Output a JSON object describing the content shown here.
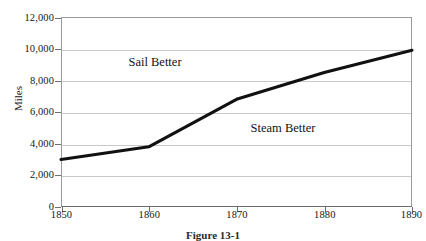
{
  "chart_data": {
    "type": "line",
    "title": "",
    "xlabel": "",
    "ylabel": "Miles",
    "x": [
      1850,
      1860,
      1870,
      1880,
      1890
    ],
    "values": [
      3000,
      3800,
      6800,
      8500,
      9900
    ],
    "series": [
      {
        "name": "Distance",
        "values": [
          3000,
          3800,
          6800,
          8500,
          9900
        ]
      }
    ],
    "xlim": [
      1850,
      1890
    ],
    "ylim": [
      0,
      12000
    ],
    "ytick_labels": [
      "12,000",
      "10,000",
      "8,000",
      "6,000",
      "4,000",
      "2,000",
      "0"
    ],
    "ytick_values": [
      12000,
      10000,
      8000,
      6000,
      4000,
      2000,
      0
    ],
    "xtick_labels": [
      "1850",
      "1860",
      "1870",
      "1880",
      "1890"
    ],
    "xtick_values": [
      1850,
      1860,
      1870,
      1880,
      1890
    ],
    "grid": "horizontal",
    "legend": "none",
    "line_color": "#111111",
    "grid_color": "#c9c9c9",
    "annotations": [
      {
        "text": "Sail Better",
        "x": 1858.2,
        "y": 8500
      },
      {
        "text": "Steam Better",
        "x": 1873.5,
        "y": 4600
      }
    ]
  },
  "caption": {
    "text": "Figure 13-1"
  }
}
